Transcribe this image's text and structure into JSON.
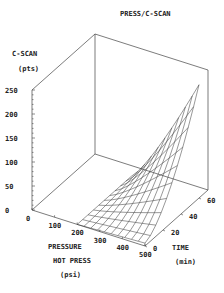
{
  "chart_data": {
    "type": "surface3d",
    "title": "PRESS/C-SCAN",
    "zlabel": "C-SCAN",
    "zunit": "(pts)",
    "xlabel": "PRESSURE",
    "xlabel2": "HOT PRESS",
    "xunit": "(psi)",
    "ylabel": "TIME",
    "yunit": "(min)",
    "z_ticks": [
      "0",
      "50",
      "100",
      "150",
      "200",
      "250"
    ],
    "x_ticks": [
      "0",
      "100",
      "200",
      "300",
      "400",
      "500"
    ],
    "y_ticks": [
      "0",
      "20",
      "40",
      "60"
    ],
    "xlim": [
      0,
      500
    ],
    "ylim": [
      0,
      70
    ],
    "zlim": [
      0,
      250
    ],
    "surface": {
      "x_range": [
        200,
        500
      ],
      "y_range": [
        0,
        60
      ],
      "z_min_approx": 0,
      "z_max_approx": 230,
      "description": "Wireframe surface rising steeply with increasing pressure and time; near 0 at low pressure/low time, peaking near 230 pts at 500 psi / 60 min"
    },
    "grid": false,
    "legend": null
  }
}
